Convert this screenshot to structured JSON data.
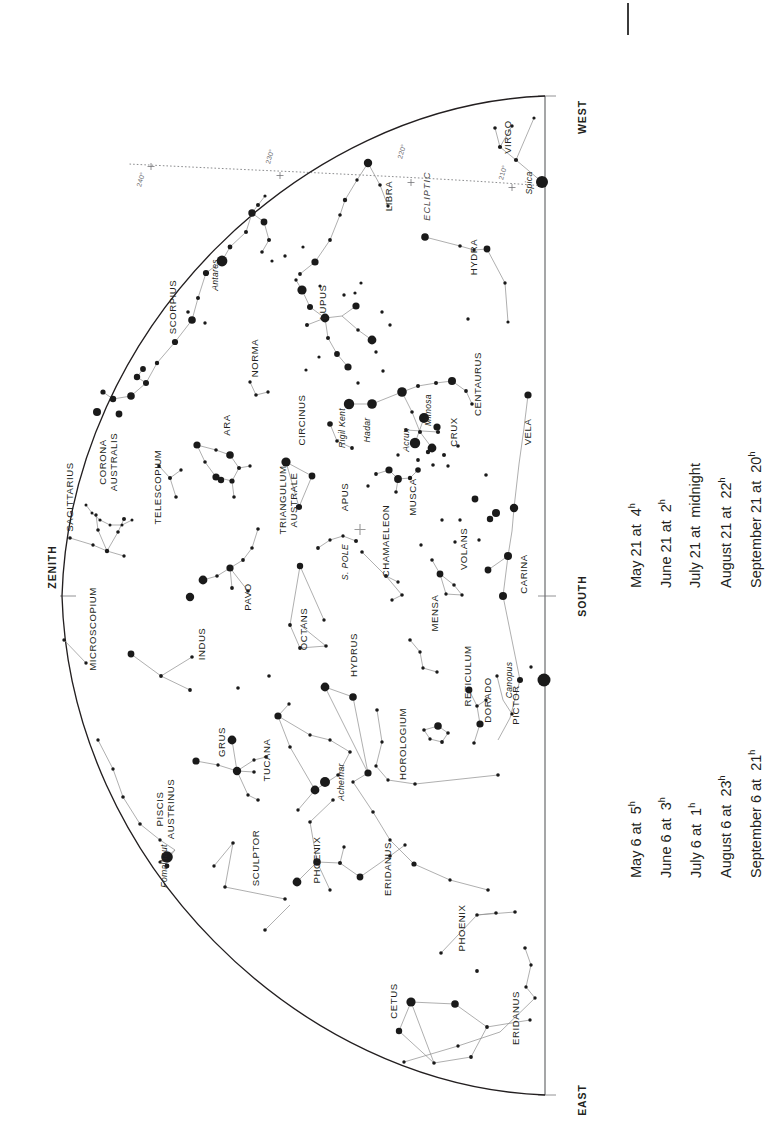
{
  "chart_meta": {
    "type": "sky-chart",
    "title": "Southern hemisphere star chart",
    "orientation": "rotated-90-ccw",
    "background_color": "#ffffff",
    "ink_color": "#231f20",
    "line_color": "#8d8d8d"
  },
  "cardinals": [
    {
      "name": "WEST",
      "x": 566,
      "y": 117
    },
    {
      "name": "SOUTH",
      "x": 566,
      "y": 596
    },
    {
      "name": "EAST",
      "x": 566,
      "y": 1100
    },
    {
      "name": "ZENITH",
      "x": 36,
      "y": 567
    }
  ],
  "ecliptic": {
    "label": "ECLIPTIC",
    "degree_marks": [
      "240°",
      "230°",
      "220°",
      "210°"
    ]
  },
  "south_pole_label": "S. POLE",
  "constellations": [
    {
      "name": "VIRGO",
      "x": 511,
      "y": 137
    },
    {
      "name": "LIBRA",
      "x": 392,
      "y": 196
    },
    {
      "name": "HYDRA",
      "x": 477,
      "y": 257
    },
    {
      "name": "SCORPIUS",
      "x": 176,
      "y": 307
    },
    {
      "name": "LUPUS",
      "x": 326,
      "y": 302
    },
    {
      "name": "NORMA",
      "x": 258,
      "y": 358
    },
    {
      "name": "CENTAURUS",
      "x": 481,
      "y": 384
    },
    {
      "name": "ARA",
      "x": 230,
      "y": 425
    },
    {
      "name": "CIRCINUS",
      "x": 305,
      "y": 420
    },
    {
      "name": "CRUX",
      "x": 457,
      "y": 432
    },
    {
      "name": "VELA",
      "x": 531,
      "y": 432
    },
    {
      "name": "CORONA AUSTRALIS",
      "x": 110,
      "y": 462
    },
    {
      "name": "SAGITTARIUS",
      "x": 73,
      "y": 497
    },
    {
      "name": "TELESCOPIUM",
      "x": 161,
      "y": 487
    },
    {
      "name": "TRIANGULUM AUSTRALE",
      "x": 290,
      "y": 500
    },
    {
      "name": "APUS",
      "x": 348,
      "y": 497
    },
    {
      "name": "MUSCA",
      "x": 416,
      "y": 497
    },
    {
      "name": "CHAMAELEON",
      "x": 389,
      "y": 541
    },
    {
      "name": "CARINA",
      "x": 527,
      "y": 574
    },
    {
      "name": "VOLANS",
      "x": 467,
      "y": 549
    },
    {
      "name": "MICROSCOPIUM",
      "x": 96,
      "y": 629
    },
    {
      "name": "PAVO",
      "x": 251,
      "y": 597
    },
    {
      "name": "INDUS",
      "x": 205,
      "y": 644
    },
    {
      "name": "OCTANS",
      "x": 307,
      "y": 629
    },
    {
      "name": "MENSA",
      "x": 438,
      "y": 613
    },
    {
      "name": "HYDRUS",
      "x": 357,
      "y": 655
    },
    {
      "name": "RETICULUM",
      "x": 471,
      "y": 676
    },
    {
      "name": "DORADO",
      "x": 491,
      "y": 700
    },
    {
      "name": "PICTOR",
      "x": 519,
      "y": 705
    },
    {
      "name": "GRUS",
      "x": 225,
      "y": 742
    },
    {
      "name": "TUCANA",
      "x": 270,
      "y": 760
    },
    {
      "name": "HOROLOGIUM",
      "x": 406,
      "y": 744
    },
    {
      "name": "PISCIS AUSTRINUS",
      "x": 167,
      "y": 809
    },
    {
      "name": "SCULPTOR",
      "x": 259,
      "y": 858
    },
    {
      "name": "PHOENIX",
      "x": 320,
      "y": 860
    },
    {
      "name": "ERIDANUS",
      "x": 391,
      "y": 869
    },
    {
      "name": "PHOENIX",
      "x": 465,
      "y": 928
    },
    {
      "name": "CETUS",
      "x": 397,
      "y": 1001
    },
    {
      "name": "ERIDANUS",
      "x": 519,
      "y": 1018
    }
  ],
  "named_stars": [
    {
      "name": "Antares",
      "x": 218,
      "y": 275
    },
    {
      "name": "Spica",
      "x": 532,
      "y": 183
    },
    {
      "name": "Rigil Kent",
      "x": 345,
      "y": 428
    },
    {
      "name": "Hadar",
      "x": 370,
      "y": 430
    },
    {
      "name": "Mimosa",
      "x": 431,
      "y": 410
    },
    {
      "name": "Acrux",
      "x": 409,
      "y": 440
    },
    {
      "name": "Canopus",
      "x": 512,
      "y": 680
    },
    {
      "name": "Achernar",
      "x": 344,
      "y": 782
    },
    {
      "name": "Fomalhaut",
      "x": 167,
      "y": 866
    }
  ],
  "legend_upper": {
    "rows": [
      {
        "date": "May 21 at",
        "time": "4",
        "unit": "h"
      },
      {
        "date": "June 21 at",
        "time": "2",
        "unit": "h"
      },
      {
        "date": "July 21 at",
        "time": "midnight",
        "unit": ""
      },
      {
        "date": "August 21 at",
        "time": "22",
        "unit": "h"
      },
      {
        "date": "September 21 at",
        "time": "20",
        "unit": "h"
      }
    ]
  },
  "legend_lower": {
    "rows": [
      {
        "date": "May 6 at",
        "time": "5",
        "unit": "h"
      },
      {
        "date": "June 6 at",
        "time": "3",
        "unit": "h"
      },
      {
        "date": "July 6 at",
        "time": "1",
        "unit": "h"
      },
      {
        "date": "August 6 at",
        "time": "23",
        "unit": "h"
      },
      {
        "date": "September 6 at",
        "time": "21",
        "unit": "h"
      }
    ]
  }
}
